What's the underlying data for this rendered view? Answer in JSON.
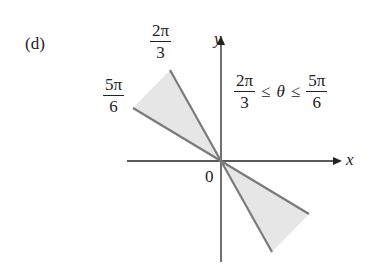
{
  "panel_label": "(d)",
  "axes": {
    "x_label": "x",
    "y_label": "y",
    "origin_label": "0"
  },
  "rays": [
    {
      "name": "ray-2pi-3",
      "label_num": "2π",
      "label_den": "3"
    },
    {
      "name": "ray-5pi-6",
      "label_num": "5π",
      "label_den": "6"
    }
  ],
  "inequality": {
    "left_num": "2π",
    "left_den": "3",
    "op1": "≤",
    "variable": "θ",
    "op2": "≤",
    "right_num": "5π",
    "right_den": "6"
  },
  "colors": {
    "shade": "#e6e6e6",
    "ray": "#7a7a7a",
    "axis": "#222222"
  }
}
